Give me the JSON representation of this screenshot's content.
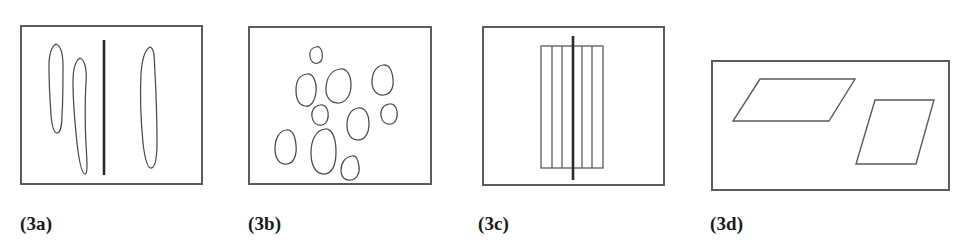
{
  "figure": {
    "width": 956,
    "height": 245,
    "background": "#ffffff",
    "stroke_color": "#5b5b5b",
    "blob_stroke_color": "#4a4a4a",
    "accent_line_color": "#2a2a2a",
    "label_color": "#1b1b1b"
  },
  "panels": [
    {
      "id": "3a",
      "label": "(3a)",
      "frame": {
        "x": 20,
        "y": 25,
        "width": 183,
        "height": 160
      },
      "label_pos": {
        "x": 20,
        "y": 214
      },
      "description": "three elongated vertical blobs separated by a vertical line",
      "content_type": "elongated-blobs-with-divider",
      "blobs": [
        "M 56 44 C 51 47 49 56 49 66 C 49 82 50 101 51 115 C 52 126 54 133 57 133 C 60 133 62 126 62 115 C 63 100 63 81 63 66 C 63 55 61 46 56 44 Z",
        "M 80 58 C 75 61 73 70 73 82 C 73 100 75 124 77 143 C 79 160 82 174 85 174 C 88 174 87 161 86 144 C 85 124 85 100 86 82 C 87 70 85 60 80 58 Z",
        "M 150 47 C 144 50 142 60 141 74 C 140 94 141 122 143 143 C 145 160 148 168 151 168 C 155 168 157 159 157 142 C 157 120 156 92 155 73 C 154 58 155 49 150 47 Z"
      ],
      "divider": {
        "x": 104,
        "y1": 40,
        "y2": 175
      }
    },
    {
      "id": "3b",
      "label": "(3b)",
      "frame": {
        "x": 248,
        "y": 26,
        "width": 184,
        "height": 159
      },
      "label_pos": {
        "x": 248,
        "y": 214
      },
      "description": "ten small scattered irregular rounded blobs",
      "content_type": "scattered-blobs",
      "blob_count": 10,
      "blobs": [
        "M 316 47 C 311 48 309 52 310 57 C 311 62 314 64 318 63 C 322 62 323 57 322 52 C 321 48 319 46 316 47 Z",
        "M 307 74 C 300 75 296 81 296 90 C 296 99 299 105 305 106 C 311 107 315 101 316 92 C 317 82 313 73 307 74 Z",
        "M 340 69 C 332 70 327 77 326 87 C 325 96 330 103 338 103 C 346 103 351 95 351 85 C 351 75 347 68 340 69 Z",
        "M 383 65 C 376 66 372 73 372 82 C 372 90 377 96 384 95 C 391 94 394 87 393 79 C 392 70 389 64 383 65 Z",
        "M 320 105 C 314 106 311 111 312 117 C 313 123 317 126 322 125 C 327 124 329 118 328 112 C 327 107 324 104 320 105 Z",
        "M 389 104 C 383 105 380 110 381 116 C 382 122 386 125 391 124 C 396 123 398 117 397 111 C 396 106 393 103 389 104 Z",
        "M 358 108 C 351 109 347 116 347 125 C 347 134 351 140 358 140 C 365 140 369 133 369 124 C 369 114 365 107 358 108 Z",
        "M 286 130 C 279 131 275 139 275 149 C 275 159 280 165 287 164 C 294 163 297 155 296 145 C 295 135 292 129 286 130 Z",
        "M 325 129 C 316 130 311 140 311 153 C 311 166 316 174 324 174 C 332 174 336 165 336 152 C 336 138 332 128 325 129 Z",
        "M 352 156 C 345 157 341 163 341 170 C 341 177 345 181 351 180 C 357 179 360 173 359 166 C 358 159 356 155 352 156 Z"
      ]
    },
    {
      "id": "3c",
      "label": "(3c)",
      "frame": {
        "x": 482,
        "y": 26,
        "width": 183,
        "height": 160
      },
      "label_pos": {
        "x": 478,
        "y": 214
      },
      "description": "rectangle subdivided into vertical strips with a heavy vertical axis line passing through",
      "content_type": "striped-rectangle-with-axis",
      "inner_rect": {
        "x": 541,
        "y": 46,
        "width": 62,
        "height": 122
      },
      "strip_lines_x": [
        552,
        562,
        573,
        582,
        592
      ],
      "axis": {
        "x": 573,
        "y1": 36,
        "y2": 180
      }
    },
    {
      "id": "3d",
      "label": "(3d)",
      "frame": {
        "x": 711,
        "y": 60,
        "width": 239,
        "height": 131
      },
      "label_pos": {
        "x": 710,
        "y": 214
      },
      "description": "two parallelograms: a wide flat one at left and a narrow upright one at right",
      "content_type": "parallelograms",
      "parallelograms": [
        {
          "name": "wide-flat-parallelogram",
          "points": "760,79 855,79 829,121 733,121"
        },
        {
          "name": "narrow-upright-parallelogram",
          "points": "875,100 934,100 916,164 856,164"
        }
      ]
    }
  ]
}
